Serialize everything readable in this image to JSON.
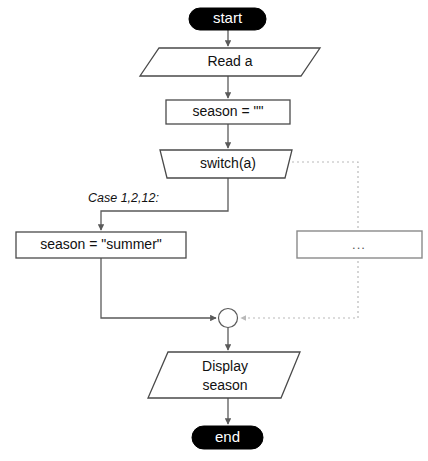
{
  "diagram": {
    "type": "flowchart",
    "colors": {
      "background": "#ffffff",
      "terminal_fill": "#000000",
      "terminal_text": "#ffffff",
      "shape_stroke": "#4a4a4a",
      "shape_fill": "#ffffff",
      "dim_stroke": "#8a8a8a",
      "line": "#5a5a5a",
      "dotted_line": "#b9b9b9"
    },
    "nodes": {
      "start": {
        "label": "start",
        "shape": "terminal"
      },
      "read": {
        "label": "Read  a",
        "shape": "parallelogram"
      },
      "init": {
        "label": "season = \"\"",
        "shape": "rectangle"
      },
      "switch": {
        "label": "switch(a)",
        "shape": "trapezoid"
      },
      "assign_summer": {
        "label": "season = \"summer\"",
        "shape": "rectangle"
      },
      "other_cases": {
        "label": "...",
        "shape": "rectangle"
      },
      "junction": {
        "label": "",
        "shape": "circle"
      },
      "display": {
        "label_line1": "Display",
        "label_line2": "season",
        "shape": "parallelogram"
      },
      "end": {
        "label": "end",
        "shape": "terminal"
      }
    },
    "edges": [
      {
        "from": "start",
        "to": "read",
        "label": "",
        "style": "solid"
      },
      {
        "from": "read",
        "to": "init",
        "label": "",
        "style": "solid"
      },
      {
        "from": "init",
        "to": "switch",
        "label": "",
        "style": "solid"
      },
      {
        "from": "switch",
        "to": "assign_summer",
        "label": "Case 1,2,12:",
        "style": "solid"
      },
      {
        "from": "switch",
        "to": "other_cases",
        "label": "",
        "style": "dotted"
      },
      {
        "from": "assign_summer",
        "to": "junction",
        "label": "",
        "style": "solid"
      },
      {
        "from": "other_cases",
        "to": "junction",
        "label": "",
        "style": "dotted"
      },
      {
        "from": "junction",
        "to": "display",
        "label": "",
        "style": "solid"
      },
      {
        "from": "display",
        "to": "end",
        "label": "",
        "style": "solid"
      }
    ],
    "edge_labels": {
      "case_branch": "Case 1,2,12:"
    }
  }
}
